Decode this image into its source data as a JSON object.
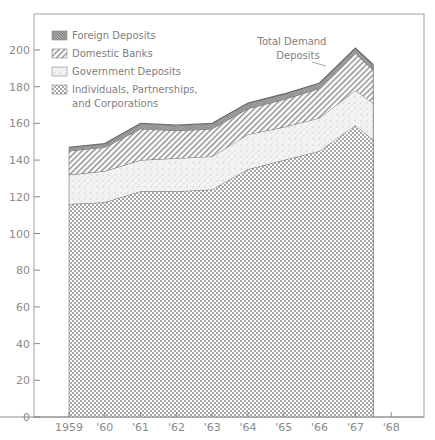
{
  "chart_data": {
    "type": "area",
    "stacked": true,
    "title": "",
    "xlabel": "",
    "ylabel": "",
    "ylim": [
      0,
      210
    ],
    "yticks": [
      0,
      20,
      40,
      60,
      80,
      100,
      120,
      140,
      160,
      180,
      200
    ],
    "x_tick_labels": [
      "1959",
      "'60",
      "'61",
      "'62",
      "'63",
      "'64",
      "'65",
      "'66",
      "'67",
      "'68"
    ],
    "x": [
      1959,
      1960,
      1961,
      1962,
      1963,
      1964,
      1965,
      1966,
      1967,
      1967.5
    ],
    "grid": false,
    "legend_position": "top-left",
    "series": [
      {
        "name": "Individuals, Partnerships, and Corporations",
        "pattern": "crosshatch",
        "values": [
          116,
          117,
          123,
          123,
          124,
          135,
          140,
          145,
          159,
          151
        ]
      },
      {
        "name": "Government Deposits",
        "pattern": "stipple",
        "values": [
          16,
          17,
          17,
          18,
          18,
          19,
          18,
          18,
          19,
          20
        ]
      },
      {
        "name": "Domestic Banks",
        "pattern": "diagonal-hatch",
        "values": [
          13,
          13,
          17,
          15,
          15,
          14,
          15,
          16,
          20,
          18
        ]
      },
      {
        "name": "Foreign Deposits",
        "pattern": "dense-hatch",
        "values": [
          2,
          2,
          3,
          3,
          3,
          3,
          3,
          3,
          3,
          3
        ]
      }
    ],
    "totals": [
      147,
      149,
      160,
      159,
      160,
      171,
      176,
      182,
      201,
      192
    ],
    "annotations": [
      {
        "text": "Total Demand Deposits",
        "points_to": "top of stack near 1966"
      }
    ]
  },
  "legend": {
    "items": [
      {
        "label": "Foreign Deposits",
        "pattern": "dense-hatch"
      },
      {
        "label": "Domestic Banks",
        "pattern": "diagonal-hatch"
      },
      {
        "label": "Government Deposits",
        "pattern": "stipple"
      },
      {
        "label": "Individuals, Partnerships,",
        "label_line2": "and Corporations",
        "pattern": "crosshatch"
      }
    ]
  },
  "annotation": {
    "line1": "Total Demand",
    "line2": "Deposits"
  },
  "colors": {
    "axis": "#8c8c8c",
    "frame": "#9a9a9a",
    "boundary": "#6e6e6e",
    "foreign_fill": "#9c9c9c",
    "domestic_hatch": "#8a8a8a",
    "government_stipple": "#b8b8b8",
    "individuals_cross": "#a6a6a6"
  }
}
